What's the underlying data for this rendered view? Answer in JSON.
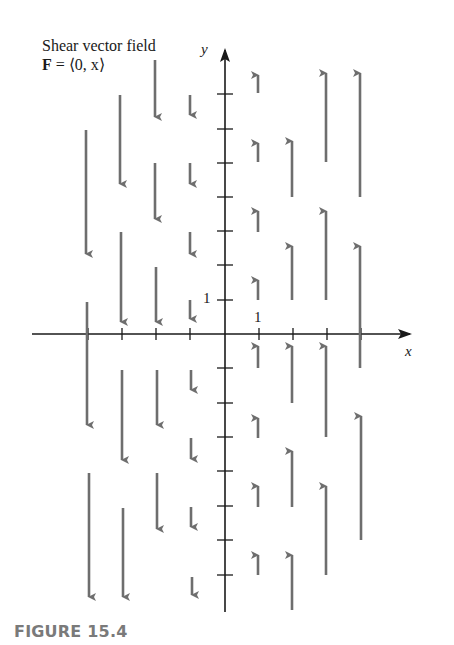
{
  "figure": {
    "title": "Shear vector field",
    "formula_bold": "F",
    "formula_rest": " = ⟨0, x⟩",
    "caption": "FIGURE 15.4",
    "x_axis_label": "x",
    "y_axis_label": "y",
    "x_tick_label": "1",
    "y_tick_label": "1",
    "colors": {
      "axis": "#1a1a1a",
      "arrow": "#6e6e6e",
      "caption": "#7a7a7a"
    }
  },
  "geometry": {
    "origin": [
      225,
      334
    ],
    "unit_px": 34.4,
    "x_axis": {
      "from": 32,
      "to": 410
    },
    "y_axis": {
      "from": 612,
      "to": 50
    },
    "x_ticks": [
      88,
      122,
      156,
      190,
      259,
      293,
      327,
      361
    ],
    "y_ticks": [
      94,
      129,
      163,
      197,
      231,
      265,
      300,
      368,
      403,
      437,
      471,
      506,
      540,
      575
    ]
  },
  "arrows": [
    {
      "x": 258,
      "y1": 93,
      "y2": 72
    },
    {
      "x": 258,
      "y1": 162,
      "y2": 140
    },
    {
      "x": 258,
      "y1": 232,
      "y2": 208
    },
    {
      "x": 258,
      "y1": 300,
      "y2": 277
    },
    {
      "x": 258,
      "y1": 368,
      "y2": 343
    },
    {
      "x": 258,
      "y1": 438,
      "y2": 415
    },
    {
      "x": 258,
      "y1": 507,
      "y2": 483
    },
    {
      "x": 258,
      "y1": 575,
      "y2": 552
    },
    {
      "x": 292,
      "y1": 197,
      "y2": 138
    },
    {
      "x": 292,
      "y1": 300,
      "y2": 243
    },
    {
      "x": 292,
      "y1": 403,
      "y2": 343
    },
    {
      "x": 292,
      "y1": 507,
      "y2": 448
    },
    {
      "x": 292,
      "y1": 610,
      "y2": 552
    },
    {
      "x": 326,
      "y1": 162,
      "y2": 70
    },
    {
      "x": 326,
      "y1": 300,
      "y2": 208
    },
    {
      "x": 326,
      "y1": 437,
      "y2": 343
    },
    {
      "x": 326,
      "y1": 575,
      "y2": 483
    },
    {
      "x": 360,
      "y1": 197,
      "y2": 70
    },
    {
      "x": 360,
      "y1": 368,
      "y2": 243
    },
    {
      "x": 361,
      "y1": 540,
      "y2": 413
    },
    {
      "x": 190,
      "y1": 95,
      "y2": 118
    },
    {
      "x": 190,
      "y1": 163,
      "y2": 187
    },
    {
      "x": 190,
      "y1": 232,
      "y2": 257
    },
    {
      "x": 190,
      "y1": 300,
      "y2": 322
    },
    {
      "x": 191,
      "y1": 370,
      "y2": 393
    },
    {
      "x": 191,
      "y1": 438,
      "y2": 462
    },
    {
      "x": 191,
      "y1": 507,
      "y2": 530
    },
    {
      "x": 192,
      "y1": 577,
      "y2": 598
    },
    {
      "x": 155,
      "y1": 60,
      "y2": 120
    },
    {
      "x": 155,
      "y1": 163,
      "y2": 222
    },
    {
      "x": 156,
      "y1": 267,
      "y2": 325
    },
    {
      "x": 157,
      "y1": 370,
      "y2": 428
    },
    {
      "x": 157,
      "y1": 473,
      "y2": 532
    },
    {
      "x": 120,
      "y1": 95,
      "y2": 187
    },
    {
      "x": 121,
      "y1": 232,
      "y2": 325
    },
    {
      "x": 122,
      "y1": 370,
      "y2": 463
    },
    {
      "x": 123,
      "y1": 508,
      "y2": 600
    },
    {
      "x": 86,
      "y1": 130,
      "y2": 257
    },
    {
      "x": 87,
      "y1": 302,
      "y2": 428
    },
    {
      "x": 89,
      "y1": 473,
      "y2": 600
    }
  ],
  "chart_data": {
    "type": "vector_field",
    "title": "Shear vector field",
    "field": "F = ⟨0, x⟩",
    "xlabel": "x",
    "ylabel": "y",
    "tick_labels": {
      "x": [
        "1"
      ],
      "y": [
        "1"
      ]
    },
    "xlim": [
      -4,
      4
    ],
    "ylim": [
      -8,
      8
    ],
    "sample_x": [
      -4,
      -3,
      -2,
      -1,
      1,
      2,
      3,
      4
    ],
    "vector_rule": "vertical arrows; length proportional to |x|; upward for x>0, downward for x<0",
    "caption": "FIGURE 15.4"
  }
}
